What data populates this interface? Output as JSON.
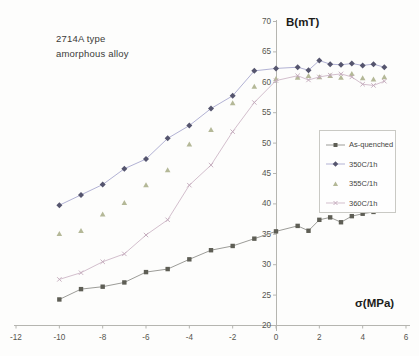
{
  "annotation": {
    "line1": "2714A type",
    "line2": "amorphous alloy"
  },
  "axes": {
    "y_title": "B(mT)",
    "x_title": "σ(MPa)"
  },
  "colors": {
    "axis_line": "#b5b5b0",
    "tick_text": "#56564f",
    "legend_border": "#c9c9c4"
  },
  "chart_data": {
    "type": "line",
    "title": "",
    "xlabel": "σ(MPa)",
    "ylabel": "B(mT)",
    "xlim": [
      -12,
      6
    ],
    "ylim": [
      20,
      70
    ],
    "grid": false,
    "legend_position": "middle-right",
    "x_ticks": [
      -12,
      -10,
      -8,
      -6,
      -4,
      -2,
      0,
      2,
      4,
      6
    ],
    "y_ticks": [
      20,
      25,
      30,
      35,
      40,
      45,
      50,
      55,
      60,
      65,
      70
    ],
    "x": [
      -10,
      -9,
      -8,
      -7,
      -6,
      -5,
      -4,
      -3,
      -2,
      -1,
      0,
      1,
      1.5,
      2,
      2.5,
      3,
      3.5,
      4,
      4.5,
      5
    ],
    "series": [
      {
        "name": "As-quenched",
        "marker": "square",
        "marker_color": "#5e5e55",
        "line_color": "#9c9c98",
        "line": true,
        "values": [
          24.2,
          25.9,
          26.3,
          27.0,
          28.7,
          29.2,
          30.8,
          32.3,
          33.0,
          34.2,
          35.4,
          36.3,
          35.5,
          37.3,
          37.7,
          36.9,
          37.9,
          38.3,
          38.6,
          39.1
        ]
      },
      {
        "name": "350C/1h",
        "marker": "diamond",
        "marker_color": "#55556e",
        "line_color": "#b2b2d4",
        "line": true,
        "values": [
          39.7,
          41.4,
          43.1,
          45.7,
          47.3,
          50.7,
          52.8,
          55.6,
          57.7,
          61.8,
          62.2,
          62.4,
          61.9,
          63.5,
          62.9,
          62.8,
          63.0,
          62.7,
          62.9,
          62.4
        ]
      },
      {
        "name": "355C/1h",
        "marker": "triangle",
        "marker_color": "#b4b897",
        "line_color": "#c9ccb0",
        "line": false,
        "values": [
          35.0,
          35.5,
          38.2,
          40.1,
          43.0,
          45.5,
          49.7,
          52.1,
          56.5,
          59.2,
          60.5,
          60.7,
          61.0,
          60.8,
          61.0,
          60.7,
          61.3,
          60.6,
          60.4,
          60.8
        ]
      },
      {
        "name": "360C/1h",
        "marker": "x",
        "marker_color": "#c2a8ba",
        "line_color": "#d3bfcd",
        "line": true,
        "values": [
          27.5,
          28.6,
          30.4,
          31.7,
          34.8,
          37.3,
          43.0,
          46.3,
          51.8,
          56.6,
          60.2,
          61.0,
          60.3,
          60.8,
          61.1,
          61.3,
          60.8,
          59.6,
          59.4,
          60.1
        ]
      }
    ]
  }
}
